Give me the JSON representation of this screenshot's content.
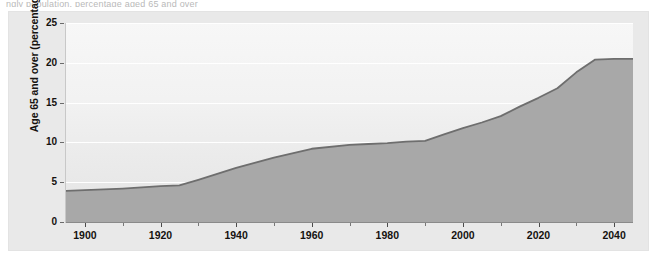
{
  "clipped_caption": "ngly population, percentage aged 65 and over",
  "colors": {
    "panel_background": "#e9e9e9",
    "plot_background_top": "#f7f7f7",
    "plot_background_bottom": "#e4e4e4",
    "area_fill": "#a8a8a8",
    "series_line": "#6e6e6e",
    "gridline": "#ffffff",
    "text": "#15120f"
  },
  "axes": {
    "y_title": "Age 65 and over (percentage)",
    "y_ticks": [
      "0",
      "5",
      "10",
      "15",
      "20",
      "25"
    ],
    "x_major_labels": [
      "1900",
      "1920",
      "1940",
      "1960",
      "1980",
      "2000",
      "2020",
      "2040"
    ],
    "x_minor_years": [
      1910,
      1930,
      1950,
      1970,
      1990,
      2010,
      2030
    ]
  },
  "chart_data": {
    "type": "area",
    "title": "",
    "subtitle": "",
    "xlabel": "",
    "ylabel": "Age 65 and over (percentage)",
    "xlim": [
      1895,
      2045
    ],
    "ylim": [
      0,
      25
    ],
    "grid": true,
    "legend": "none",
    "x_tick_labels": [
      "1900",
      "1920",
      "1940",
      "1960",
      "1980",
      "2000",
      "2020",
      "2040"
    ],
    "y_tick_labels": [
      "0",
      "5",
      "10",
      "15",
      "20",
      "25"
    ],
    "series": [
      {
        "name": "Age 65 and over (percentage)",
        "x": [
          1895,
          1900,
          1910,
          1920,
          1925,
          1930,
          1940,
          1950,
          1960,
          1970,
          1975,
          1980,
          1985,
          1990,
          1995,
          2000,
          2005,
          2010,
          2015,
          2020,
          2025,
          2030,
          2035,
          2040,
          2045
        ],
        "values": [
          3.9,
          4.0,
          4.2,
          4.5,
          4.6,
          5.3,
          6.8,
          8.1,
          9.2,
          9.7,
          9.8,
          9.9,
          10.1,
          10.2,
          11.0,
          11.8,
          12.5,
          13.3,
          14.5,
          15.6,
          16.8,
          18.8,
          20.4,
          20.5,
          20.5
        ]
      }
    ]
  }
}
